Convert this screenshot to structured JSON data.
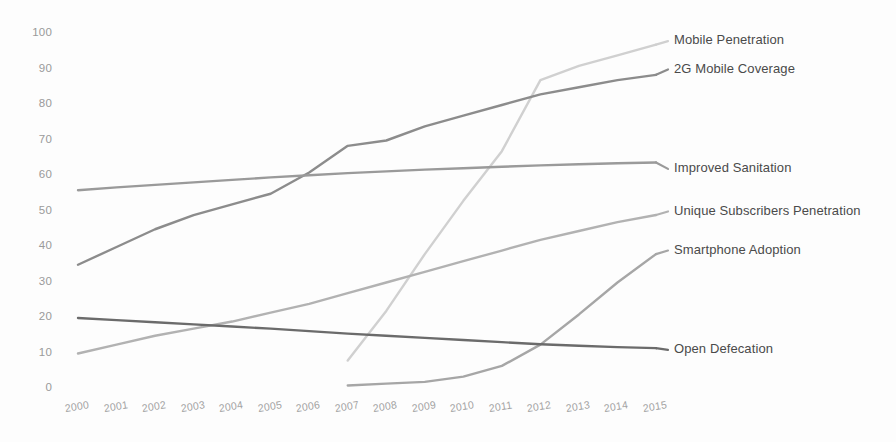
{
  "chart_data": {
    "type": "line",
    "title": "",
    "xlabel": "",
    "ylabel": "",
    "x": [
      2000,
      2001,
      2002,
      2003,
      2004,
      2005,
      2006,
      2007,
      2008,
      2009,
      2010,
      2011,
      2012,
      2013,
      2014,
      2015
    ],
    "categories": [
      "2000",
      "2001",
      "2002",
      "2003",
      "2004",
      "2005",
      "2006",
      "2007",
      "2008",
      "2009",
      "2010",
      "2011",
      "2012",
      "2013",
      "2014",
      "2015"
    ],
    "ylim": [
      0,
      100
    ],
    "xlim": [
      2000,
      2015
    ],
    "yticks": [
      0,
      10,
      20,
      30,
      40,
      50,
      60,
      70,
      80,
      90,
      100
    ],
    "ytick_labels": [
      "0",
      "10",
      "20",
      "30",
      "40",
      "50",
      "60",
      "70",
      "80",
      "90",
      "100"
    ],
    "grid": false,
    "legend_position": "right-of-line-ends",
    "series": [
      {
        "name": "Mobile Penetration",
        "color": "#d0d0d0",
        "label_color": "#4a4a4a",
        "values": [
          null,
          null,
          null,
          null,
          null,
          null,
          null,
          8,
          22,
          38,
          53,
          67,
          87,
          91,
          94,
          97
        ],
        "label_y_value": 98
      },
      {
        "name": "2G Mobile Coverage",
        "color": "#8c8c8c",
        "label_color": "#4a4a4a",
        "values": [
          35,
          40,
          45,
          49,
          52,
          55,
          61,
          68.5,
          70,
          74,
          77,
          80,
          83,
          85,
          87,
          88.5
        ],
        "label_y_value": 90
      },
      {
        "name": "Improved Sanitation",
        "color": "#9a9a9a",
        "label_color": "#4a4a4a",
        "values": [
          56,
          56.8,
          57.5,
          58.2,
          58.9,
          59.6,
          60.2,
          60.8,
          61.3,
          61.8,
          62.2,
          62.6,
          63,
          63.3,
          63.6,
          63.8
        ],
        "label_y_value": 62
      },
      {
        "name": "Unique Subscribers Penetration",
        "color": "#b2b2b2",
        "label_color": "#4a4a4a",
        "values": [
          10,
          12.5,
          15,
          17,
          19,
          21.5,
          24,
          27,
          30,
          33,
          36,
          39,
          42,
          44.5,
          47,
          49
        ],
        "label_y_value": 50
      },
      {
        "name": "Smartphone Adoption",
        "color": "#a6a6a6",
        "label_color": "#4a4a4a",
        "values": [
          null,
          null,
          null,
          null,
          null,
          null,
          null,
          1,
          1.5,
          2,
          3.5,
          6.5,
          12.5,
          21,
          30,
          38
        ],
        "label_y_value": 39
      },
      {
        "name": "Open Defecation",
        "color": "#6b6b6b",
        "label_color": "#4a4a4a",
        "values": [
          20,
          19.4,
          18.8,
          18.2,
          17.6,
          17,
          16.3,
          15.6,
          15,
          14.4,
          13.8,
          13.2,
          12.6,
          12.2,
          11.8,
          11.5
        ],
        "label_y_value": 11
      }
    ]
  },
  "background_color": "#fdfdfd",
  "tick_color": "#9a9a9a"
}
